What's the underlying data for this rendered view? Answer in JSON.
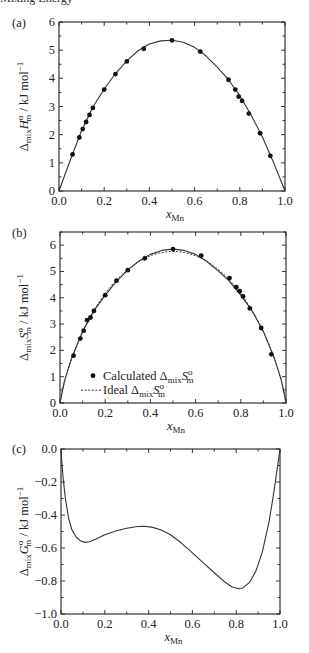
{
  "header": {
    "cut_text": "Mixing Energy"
  },
  "chart_data": [
    {
      "panel": "(a)",
      "type": "scatter",
      "title": "",
      "xlabel": "x_Mn",
      "ylabel": "Δmix H°m / kJ mol⁻¹",
      "xlim": [
        0.0,
        1.0
      ],
      "ylim": [
        0,
        6
      ],
      "xticks": [
        "0.0",
        "0.2",
        "0.4",
        "0.6",
        "0.8",
        "1.0"
      ],
      "yticks": [
        "0",
        "1",
        "2",
        "3",
        "4",
        "5",
        "6"
      ],
      "grid": false,
      "series": [
        {
          "name": "Data points",
          "style": "markers",
          "x": [
            0.06,
            0.09,
            0.105,
            0.12,
            0.135,
            0.15,
            0.2,
            0.25,
            0.3,
            0.375,
            0.5,
            0.625,
            0.75,
            0.78,
            0.795,
            0.81,
            0.84,
            0.89,
            0.935
          ],
          "y": [
            1.3,
            1.9,
            2.2,
            2.45,
            2.7,
            2.95,
            3.6,
            4.15,
            4.6,
            5.05,
            5.35,
            4.95,
            3.95,
            3.6,
            3.35,
            3.2,
            2.75,
            2.05,
            1.25
          ]
        },
        {
          "name": "Fit",
          "style": "solid-line",
          "x": [
            0,
            0.05,
            0.1,
            0.15,
            0.2,
            0.25,
            0.3,
            0.35,
            0.4,
            0.45,
            0.5,
            0.55,
            0.6,
            0.65,
            0.7,
            0.75,
            0.8,
            0.85,
            0.9,
            0.95,
            1.0
          ],
          "y": [
            0,
            1.1,
            2.15,
            2.98,
            3.62,
            4.17,
            4.62,
            4.98,
            5.22,
            5.33,
            5.35,
            5.28,
            5.1,
            4.8,
            4.4,
            3.95,
            3.38,
            2.7,
            1.92,
            1.0,
            0
          ]
        }
      ]
    },
    {
      "panel": "(b)",
      "type": "scatter",
      "title": "",
      "xlabel": "x_Mn",
      "ylabel": "Δmix S°m / kJ mol⁻¹",
      "xlim": [
        0.0,
        1.0
      ],
      "ylim": [
        0,
        6.5
      ],
      "xticks": [
        "0.0",
        "0.2",
        "0.4",
        "0.6",
        "0.8",
        "1.0"
      ],
      "yticks": [
        "0",
        "1",
        "2",
        "3",
        "4",
        "5",
        "6"
      ],
      "grid": false,
      "legend": {
        "position": "lower-left",
        "entries": [
          {
            "marker": "dot",
            "label": "Calculated ΔmixS°m"
          },
          {
            "marker": "dashed-line",
            "label": "Ideal ΔmixS°m"
          }
        ]
      },
      "series": [
        {
          "name": "Calculated ΔmixS°m",
          "style": "markers",
          "x": [
            0.06,
            0.09,
            0.105,
            0.12,
            0.135,
            0.15,
            0.2,
            0.25,
            0.3,
            0.375,
            0.5,
            0.625,
            0.75,
            0.78,
            0.795,
            0.81,
            0.84,
            0.89,
            0.935
          ],
          "y": [
            1.8,
            2.45,
            2.75,
            3.15,
            3.25,
            3.5,
            4.1,
            4.65,
            5.05,
            5.5,
            5.85,
            5.6,
            4.75,
            4.4,
            4.25,
            4.05,
            3.6,
            2.85,
            1.85
          ]
        },
        {
          "name": "Calculated fit",
          "style": "solid-line",
          "x": [
            0,
            0.02,
            0.05,
            0.1,
            0.15,
            0.2,
            0.25,
            0.3,
            0.35,
            0.4,
            0.45,
            0.5,
            0.55,
            0.6,
            0.65,
            0.7,
            0.75,
            0.8,
            0.85,
            0.9,
            0.95,
            0.98,
            1.0
          ],
          "y": [
            0,
            0.85,
            1.67,
            2.72,
            3.5,
            4.1,
            4.62,
            5.05,
            5.4,
            5.65,
            5.8,
            5.85,
            5.8,
            5.65,
            5.38,
            5.02,
            4.62,
            4.1,
            3.5,
            2.72,
            1.67,
            0.85,
            0
          ]
        },
        {
          "name": "Ideal ΔmixS°m",
          "style": "dashed-line",
          "peak": 5.76
        }
      ]
    },
    {
      "panel": "(c)",
      "type": "line",
      "title": "",
      "xlabel": "x_Mn",
      "ylabel": "Δmix G°m / kJ mol⁻¹",
      "xlim": [
        0.0,
        1.0
      ],
      "ylim": [
        -1.0,
        0.0
      ],
      "xticks": [
        "0.0",
        "0.2",
        "0.4",
        "0.6",
        "0.8",
        "1.0"
      ],
      "yticks": [
        "0.0",
        "−0.2",
        "−0.4",
        "−0.6",
        "−0.8",
        "−1.0"
      ],
      "grid": false,
      "series": [
        {
          "name": "ΔmixG°m",
          "style": "solid-line",
          "x": [
            0,
            0.005,
            0.01,
            0.02,
            0.035,
            0.05,
            0.07,
            0.09,
            0.11,
            0.13,
            0.16,
            0.2,
            0.25,
            0.3,
            0.35,
            0.38,
            0.42,
            0.46,
            0.5,
            0.55,
            0.6,
            0.65,
            0.7,
            0.75,
            0.78,
            0.81,
            0.83,
            0.86,
            0.89,
            0.92,
            0.95,
            0.97,
            0.985,
            1.0
          ],
          "y": [
            0,
            -0.1,
            -0.18,
            -0.3,
            -0.42,
            -0.49,
            -0.535,
            -0.558,
            -0.566,
            -0.562,
            -0.545,
            -0.52,
            -0.497,
            -0.48,
            -0.47,
            -0.468,
            -0.475,
            -0.492,
            -0.52,
            -0.57,
            -0.63,
            -0.69,
            -0.75,
            -0.808,
            -0.835,
            -0.847,
            -0.842,
            -0.81,
            -0.74,
            -0.62,
            -0.44,
            -0.28,
            -0.14,
            0
          ]
        }
      ]
    }
  ]
}
